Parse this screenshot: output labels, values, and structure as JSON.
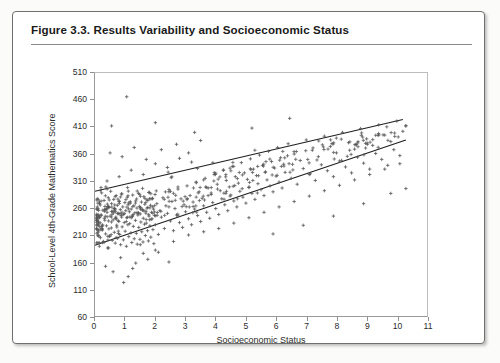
{
  "figure": {
    "title": "Figure 3.3.  Results Variability and Socioeconomic Status"
  },
  "chart_data": {
    "type": "scatter",
    "title": "Figure 3.3.  Results Variability and Socioeconomic Status",
    "xlabel": "Socioeconomic Status",
    "ylabel": "School-Level 4th-Grade Mathematics Score",
    "xlim": [
      0,
      11
    ],
    "ylim": [
      60,
      510
    ],
    "xticks": [
      0,
      1,
      2,
      3,
      4,
      5,
      6,
      7,
      8,
      9,
      10,
      11
    ],
    "yticks": [
      60,
      110,
      160,
      210,
      260,
      310,
      360,
      410,
      460,
      510
    ],
    "grid": false,
    "legend": null,
    "marker": "plus",
    "marker_color": "#555555",
    "line_color": "#1f1f1f",
    "n_points": 612,
    "annotations": [],
    "reference_lines": [
      {
        "name": "upper-envelope",
        "x": [
          0.0,
          10.2
        ],
        "y": [
          291,
          424
        ]
      },
      {
        "name": "lower-envelope",
        "x": [
          0.0,
          10.3
        ],
        "y": [
          191,
          386
        ]
      }
    ],
    "series": [
      {
        "name": "schools",
        "description": "School-level mean mathematics score plotted against socioeconomic status; density concentrated at low SES with a widening upward band",
        "points": [
          [
            0.12,
            232
          ],
          [
            0.15,
            268
          ],
          [
            0.18,
            205
          ],
          [
            0.2,
            247
          ],
          [
            0.22,
            288
          ],
          [
            0.24,
            219
          ],
          [
            0.26,
            256
          ],
          [
            0.28,
            198
          ],
          [
            0.3,
            274
          ],
          [
            0.31,
            241
          ],
          [
            0.33,
            263
          ],
          [
            0.35,
            212
          ],
          [
            0.36,
            299
          ],
          [
            0.38,
            227
          ],
          [
            0.4,
            252
          ],
          [
            0.42,
            186
          ],
          [
            0.44,
            279
          ],
          [
            0.45,
            236
          ],
          [
            0.47,
            261
          ],
          [
            0.49,
            208
          ],
          [
            0.5,
            245
          ],
          [
            0.52,
            291
          ],
          [
            0.54,
            223
          ],
          [
            0.55,
            268
          ],
          [
            0.57,
            200
          ],
          [
            0.59,
            254
          ],
          [
            0.6,
            238
          ],
          [
            0.62,
            276
          ],
          [
            0.64,
            215
          ],
          [
            0.65,
            259
          ],
          [
            0.67,
            195
          ],
          [
            0.69,
            243
          ],
          [
            0.7,
            283
          ],
          [
            0.72,
            228
          ],
          [
            0.74,
            265
          ],
          [
            0.75,
            204
          ],
          [
            0.77,
            250
          ],
          [
            0.79,
            235
          ],
          [
            0.8,
            272
          ],
          [
            0.82,
            211
          ],
          [
            0.84,
            257
          ],
          [
            0.85,
            192
          ],
          [
            0.87,
            246
          ],
          [
            0.89,
            286
          ],
          [
            0.9,
            225
          ],
          [
            0.92,
            262
          ],
          [
            0.94,
            201
          ],
          [
            0.95,
            248
          ],
          [
            0.97,
            233
          ],
          [
            0.99,
            270
          ],
          [
            1.0,
            217
          ],
          [
            1.02,
            255
          ],
          [
            1.04,
            189
          ],
          [
            1.05,
            242
          ],
          [
            1.07,
            280
          ],
          [
            1.09,
            229
          ],
          [
            1.1,
            266
          ],
          [
            1.12,
            207
          ],
          [
            1.14,
            253
          ],
          [
            1.15,
            231
          ],
          [
            1.17,
            269
          ],
          [
            1.19,
            214
          ],
          [
            1.2,
            258
          ],
          [
            1.22,
            196
          ],
          [
            1.24,
            244
          ],
          [
            1.25,
            284
          ],
          [
            1.27,
            226
          ],
          [
            1.29,
            264
          ],
          [
            1.3,
            203
          ],
          [
            1.32,
            251
          ],
          [
            1.34,
            237
          ],
          [
            1.35,
            273
          ],
          [
            1.37,
            213
          ],
          [
            1.39,
            260
          ],
          [
            1.4,
            193
          ],
          [
            1.42,
            247
          ],
          [
            1.44,
            287
          ],
          [
            1.45,
            224
          ],
          [
            1.47,
            263
          ],
          [
            1.49,
            202
          ],
          [
            1.5,
            249
          ],
          [
            1.52,
            234
          ],
          [
            1.54,
            271
          ],
          [
            1.55,
            216
          ],
          [
            1.57,
            256
          ],
          [
            1.59,
            197
          ],
          [
            1.6,
            241
          ],
          [
            1.62,
            281
          ],
          [
            1.64,
            230
          ],
          [
            1.65,
            267
          ],
          [
            1.67,
            209
          ],
          [
            1.69,
            254
          ],
          [
            1.7,
            232
          ],
          [
            1.72,
            275
          ],
          [
            1.74,
            218
          ],
          [
            1.75,
            261
          ],
          [
            1.77,
            199
          ],
          [
            1.79,
            245
          ],
          [
            1.8,
            289
          ],
          [
            1.82,
            227
          ],
          [
            1.84,
            265
          ],
          [
            1.85,
            206
          ],
          [
            1.87,
            252
          ],
          [
            1.89,
            240
          ],
          [
            1.9,
            277
          ],
          [
            1.92,
            220
          ],
          [
            1.94,
            258
          ],
          [
            1.95,
            194
          ],
          [
            1.97,
            246
          ],
          [
            1.99,
            285
          ],
          [
            2.0,
            229
          ],
          [
            2.05,
            268
          ],
          [
            2.1,
            211
          ],
          [
            2.15,
            255
          ],
          [
            2.2,
            243
          ],
          [
            2.25,
            279
          ],
          [
            2.3,
            222
          ],
          [
            2.35,
            264
          ],
          [
            2.4,
            250
          ],
          [
            2.45,
            290
          ],
          [
            2.5,
            236
          ],
          [
            2.55,
            272
          ],
          [
            2.6,
            218
          ],
          [
            2.65,
            259
          ],
          [
            2.7,
            247
          ],
          [
            2.75,
            295
          ],
          [
            2.8,
            233
          ],
          [
            2.85,
            277
          ],
          [
            2.9,
            224
          ],
          [
            2.95,
            266
          ],
          [
            3.0,
            253
          ],
          [
            3.05,
            301
          ],
          [
            3.1,
            240
          ],
          [
            3.15,
            283
          ],
          [
            3.2,
            229
          ],
          [
            3.25,
            271
          ],
          [
            3.3,
            258
          ],
          [
            3.35,
            308
          ],
          [
            3.4,
            246
          ],
          [
            3.45,
            290
          ],
          [
            3.5,
            235
          ],
          [
            3.55,
            278
          ],
          [
            3.6,
            264
          ],
          [
            3.65,
            315
          ],
          [
            3.7,
            252
          ],
          [
            3.75,
            297
          ],
          [
            3.8,
            241
          ],
          [
            3.85,
            285
          ],
          [
            3.9,
            270
          ],
          [
            3.95,
            322
          ],
          [
            4.0,
            259
          ],
          [
            4.05,
            304
          ],
          [
            4.1,
            248
          ],
          [
            4.15,
            292
          ],
          [
            4.2,
            277
          ],
          [
            4.25,
            330
          ],
          [
            4.3,
            266
          ],
          [
            4.35,
            311
          ],
          [
            4.4,
            255
          ],
          [
            4.45,
            299
          ],
          [
            4.5,
            284
          ],
          [
            4.55,
            337
          ],
          [
            4.6,
            273
          ],
          [
            4.65,
            318
          ],
          [
            4.7,
            262
          ],
          [
            4.75,
            306
          ],
          [
            4.8,
            291
          ],
          [
            4.85,
            344
          ],
          [
            4.9,
            280
          ],
          [
            4.95,
            325
          ],
          [
            5.0,
            269
          ],
          [
            5.05,
            313
          ],
          [
            5.1,
            298
          ],
          [
            5.15,
            351
          ],
          [
            5.2,
            287
          ],
          [
            5.25,
            332
          ],
          [
            5.3,
            276
          ],
          [
            5.35,
            320
          ],
          [
            5.4,
            305
          ],
          [
            5.45,
            358
          ],
          [
            5.5,
            294
          ],
          [
            5.55,
            339
          ],
          [
            5.6,
            283
          ],
          [
            5.65,
            327
          ],
          [
            5.7,
            312
          ],
          [
            5.75,
            365
          ],
          [
            5.8,
            301
          ],
          [
            5.85,
            346
          ],
          [
            5.9,
            290
          ],
          [
            5.95,
            334
          ],
          [
            6.0,
            319
          ],
          [
            6.05,
            372
          ],
          [
            6.1,
            308
          ],
          [
            6.15,
            353
          ],
          [
            6.2,
            297
          ],
          [
            6.25,
            341
          ],
          [
            6.3,
            326
          ],
          [
            6.4,
            379
          ],
          [
            6.5,
            315
          ],
          [
            6.6,
            360
          ],
          [
            6.7,
            304
          ],
          [
            6.8,
            348
          ],
          [
            6.9,
            333
          ],
          [
            7.0,
            386
          ],
          [
            7.1,
            322
          ],
          [
            7.2,
            367
          ],
          [
            7.3,
            311
          ],
          [
            7.4,
            355
          ],
          [
            7.5,
            340
          ],
          [
            7.6,
            393
          ],
          [
            7.7,
            329
          ],
          [
            7.8,
            374
          ],
          [
            7.9,
            318
          ],
          [
            8.0,
            362
          ],
          [
            8.1,
            347
          ],
          [
            8.2,
            400
          ],
          [
            8.3,
            336
          ],
          [
            8.4,
            381
          ],
          [
            8.5,
            325
          ],
          [
            8.6,
            369
          ],
          [
            8.7,
            354
          ],
          [
            8.8,
            407
          ],
          [
            8.9,
            343
          ],
          [
            9.0,
            388
          ],
          [
            9.1,
            332
          ],
          [
            9.2,
            376
          ],
          [
            9.3,
            361
          ],
          [
            9.4,
            414
          ],
          [
            9.5,
            350
          ],
          [
            9.6,
            395
          ],
          [
            9.7,
            339
          ],
          [
            9.8,
            383
          ],
          [
            9.9,
            368
          ],
          [
            10.0,
            421
          ],
          [
            10.1,
            357
          ],
          [
            10.2,
            402
          ],
          [
            0.55,
            412
          ],
          [
            1.05,
            466
          ],
          [
            2.0,
            418
          ],
          [
            3.3,
            400
          ],
          [
            5.2,
            408
          ],
          [
            6.45,
            426
          ],
          [
            0.35,
            152
          ],
          [
            0.6,
            142
          ],
          [
            0.85,
            168
          ],
          [
            1.1,
            133
          ],
          [
            1.35,
            158
          ],
          [
            1.6,
            176
          ],
          [
            0.45,
            186
          ],
          [
            0.95,
            122
          ],
          [
            1.25,
            148
          ],
          [
            1.75,
            165
          ],
          [
            2.1,
            178
          ],
          [
            2.45,
            160
          ],
          [
            0.25,
            196
          ],
          [
            0.7,
            205
          ],
          [
            1.5,
            192
          ],
          [
            2.0,
            182
          ],
          [
            2.6,
            198
          ],
          [
            3.1,
            210
          ],
          [
            3.6,
            216
          ],
          [
            4.1,
            222
          ],
          [
            4.6,
            232
          ],
          [
            5.1,
            242
          ],
          [
            5.6,
            252
          ],
          [
            6.1,
            262
          ],
          [
            6.6,
            272
          ],
          [
            7.1,
            282
          ],
          [
            7.6,
            292
          ],
          [
            8.1,
            302
          ],
          [
            8.6,
            312
          ],
          [
            9.1,
            322
          ],
          [
            9.6,
            332
          ],
          [
            10.1,
            342
          ],
          [
            10.3,
            296
          ],
          [
            9.8,
            287
          ],
          [
            8.9,
            268
          ],
          [
            7.9,
            245
          ],
          [
            6.9,
            228
          ],
          [
            5.9,
            212
          ],
          [
            0.4,
            310
          ],
          [
            0.8,
            318
          ],
          [
            1.2,
            330
          ],
          [
            1.6,
            322
          ],
          [
            2.0,
            342
          ],
          [
            2.4,
            335
          ],
          [
            2.8,
            352
          ],
          [
            3.2,
            345
          ],
          [
            0.5,
            362
          ],
          [
            0.9,
            355
          ],
          [
            1.3,
            372
          ],
          [
            1.7,
            350
          ],
          [
            2.2,
            368
          ],
          [
            2.7,
            378
          ],
          [
            3.1,
            362
          ],
          [
            3.5,
            385
          ]
        ]
      }
    ]
  }
}
